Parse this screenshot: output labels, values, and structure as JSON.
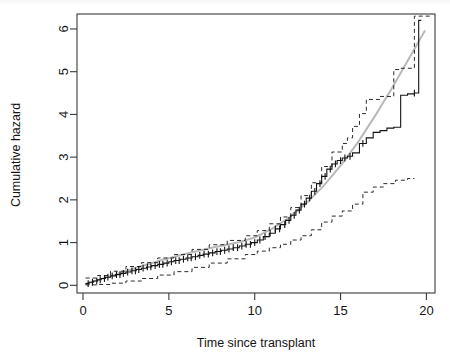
{
  "figure": {
    "kind": "scanned-statistical-plot",
    "top_title": "",
    "background_color": "#ffffff",
    "ink_color": "#141414",
    "reference_line_color": "#b9b9b9"
  },
  "chart_data": {
    "type": "line",
    "title": "",
    "subtitle": "",
    "xlabel": "Time since transplant",
    "ylabel": "Cumulative hazard",
    "xlim": [
      -0.35,
      20.5
    ],
    "ylim": [
      -0.18,
      6.35
    ],
    "xticks": [
      0,
      5,
      10,
      15,
      20
    ],
    "yticks": [
      0,
      1,
      2,
      3,
      4,
      5,
      6
    ],
    "xtick_labels": [
      "0",
      "5",
      "10",
      "15",
      "20"
    ],
    "ytick_labels": [
      "0",
      "1",
      "2",
      "3",
      "4",
      "5",
      "6"
    ],
    "grid": false,
    "legend": null,
    "legend_position": "none",
    "box": true,
    "annotations": [
      "step function with censoring tick marks",
      "dashed pointwise confidence limits above and below",
      "light grey smooth reference curve"
    ],
    "series": [
      {
        "name": "Nelson-Aalen cumulative hazard estimate",
        "style": "step",
        "color": "#141414",
        "linewidth": 1.1,
        "x": [
          0.15,
          0.35,
          0.6,
          0.85,
          1.05,
          1.3,
          1.6,
          1.9,
          2.2,
          2.5,
          2.8,
          3.1,
          3.4,
          3.7,
          4.0,
          4.35,
          4.7,
          5.0,
          5.3,
          5.65,
          6.0,
          6.35,
          6.7,
          7.0,
          7.35,
          7.7,
          8.05,
          8.4,
          8.75,
          9.1,
          9.45,
          9.8,
          10.15,
          10.5,
          10.85,
          11.2,
          11.5,
          11.8,
          12.1,
          12.4,
          12.7,
          13.0,
          13.3,
          13.6,
          13.9,
          14.2,
          14.5,
          14.8,
          15.1,
          15.4,
          15.7,
          16.1,
          16.5,
          16.9,
          17.3,
          17.7,
          18.1,
          18.5,
          18.9,
          19.3,
          19.55,
          19.7
        ],
        "y": [
          0.04,
          0.07,
          0.1,
          0.13,
          0.16,
          0.19,
          0.22,
          0.25,
          0.28,
          0.31,
          0.34,
          0.37,
          0.4,
          0.43,
          0.46,
          0.49,
          0.52,
          0.55,
          0.58,
          0.61,
          0.64,
          0.67,
          0.7,
          0.73,
          0.76,
          0.79,
          0.82,
          0.85,
          0.88,
          0.92,
          0.96,
          1.0,
          1.06,
          1.14,
          1.22,
          1.32,
          1.42,
          1.52,
          1.64,
          1.76,
          1.9,
          2.04,
          2.2,
          2.38,
          2.55,
          2.72,
          2.84,
          2.92,
          2.98,
          3.02,
          3.1,
          3.32,
          3.45,
          3.58,
          3.62,
          3.68,
          3.7,
          4.45,
          4.48,
          4.5,
          6.2,
          6.2
        ]
      },
      {
        "name": "Upper confidence limit",
        "style": "dashed",
        "color": "#141414",
        "linewidth": 0.9,
        "x": [
          0.15,
          0.85,
          1.6,
          2.5,
          3.4,
          4.35,
          5.3,
          6.35,
          7.35,
          8.4,
          9.45,
          10.15,
          10.85,
          11.5,
          12.1,
          12.7,
          13.3,
          13.9,
          14.5,
          15.1,
          15.4,
          15.7,
          16.1,
          16.5,
          17.3,
          18.1,
          18.5,
          19.3,
          19.7,
          20.2
        ],
        "y": [
          0.17,
          0.23,
          0.33,
          0.44,
          0.53,
          0.64,
          0.72,
          0.84,
          0.95,
          1.05,
          1.16,
          1.28,
          1.44,
          1.6,
          1.82,
          2.1,
          2.4,
          2.78,
          3.12,
          3.32,
          3.45,
          3.72,
          4.02,
          4.35,
          4.42,
          5.05,
          5.08,
          6.3,
          6.3,
          6.3
        ]
      },
      {
        "name": "Lower confidence limit",
        "style": "dashed",
        "color": "#141414",
        "linewidth": 0.9,
        "x": [
          0.15,
          0.85,
          1.6,
          2.5,
          3.4,
          4.35,
          5.3,
          6.35,
          7.35,
          8.4,
          9.45,
          10.15,
          10.85,
          11.5,
          12.1,
          12.7,
          13.3,
          13.9,
          14.5,
          15.1,
          15.7,
          16.3,
          16.9,
          17.5,
          18.2,
          18.9,
          19.3
        ],
        "y": [
          0.01,
          0.02,
          0.05,
          0.1,
          0.16,
          0.24,
          0.32,
          0.42,
          0.52,
          0.62,
          0.72,
          0.8,
          0.88,
          0.96,
          1.06,
          1.16,
          1.3,
          1.48,
          1.62,
          1.74,
          1.9,
          2.18,
          2.3,
          2.38,
          2.46,
          2.5,
          2.5
        ]
      },
      {
        "name": "Smooth reference curve",
        "style": "solid",
        "color": "#b9b9b9",
        "linewidth": 2.0,
        "x": [
          0.15,
          1.5,
          3.0,
          4.5,
          6.0,
          7.5,
          9.0,
          10.0,
          11.0,
          12.0,
          13.0,
          14.0,
          15.0,
          16.0,
          17.0,
          18.0,
          19.0,
          19.9
        ],
        "y": [
          0.03,
          0.2,
          0.4,
          0.58,
          0.74,
          0.88,
          1.0,
          1.12,
          1.32,
          1.58,
          1.92,
          2.32,
          2.8,
          3.34,
          3.96,
          4.62,
          5.32,
          5.95
        ]
      }
    ],
    "censoring_marks": {
      "name": "Censored observation ticks",
      "symbol": "+",
      "color": "#141414",
      "x": [
        0.3,
        0.55,
        0.8,
        1.0,
        1.25,
        1.45,
        1.7,
        1.95,
        2.15,
        2.35,
        2.6,
        2.85,
        3.05,
        3.25,
        3.5,
        3.75,
        3.95,
        4.2,
        4.45,
        4.65,
        4.9,
        5.15,
        5.4,
        5.6,
        5.85,
        6.1,
        6.3,
        6.55,
        6.8,
        7.05,
        7.3,
        7.55,
        7.8,
        8.0,
        8.25,
        8.5,
        8.75,
        9.0,
        9.25,
        9.5,
        9.75,
        10.0,
        10.3,
        10.6,
        10.9,
        11.2,
        11.45,
        11.75,
        12.0,
        12.3,
        12.6,
        12.9,
        13.2,
        13.5,
        13.8,
        14.1,
        14.4,
        14.7,
        15.0,
        15.25,
        15.55,
        16.3,
        19.3
      ]
    }
  }
}
